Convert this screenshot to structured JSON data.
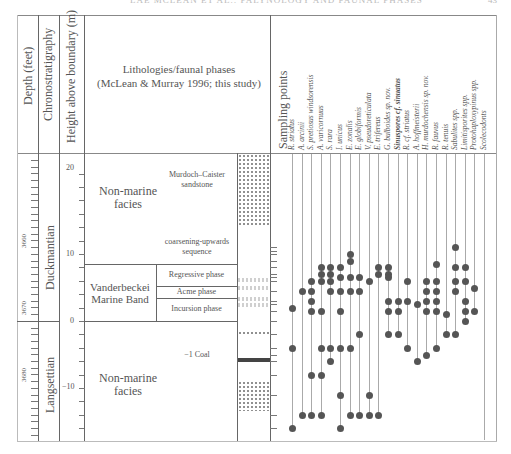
{
  "page": {
    "running_header": "LAE MCLEAN ET AL.: PALYNOLOGY AND FAUNAL PHASES",
    "page_number": "43"
  },
  "headers": {
    "depth": "Depth (feet)",
    "chrono": "Chronostratigraphy",
    "height": "Height above boundary (m)",
    "lithology_line1": "Lithologies/faunal phases",
    "lithology_line2": "(McLean & Murray 1996; this study)",
    "sampling": "Sampling points"
  },
  "depth_ticks": [
    "3660",
    "3670",
    "3680"
  ],
  "height_ticks": [
    "20",
    "10",
    "0",
    "−10"
  ],
  "stages": {
    "upper": "Duckmantian",
    "lower": "Langsettian"
  },
  "lithology": {
    "upper_facies_line1": "Non-marine",
    "upper_facies_line2": "facies",
    "sandstone_line1": "Murdoch–Caister",
    "sandstone_line2": "sandstone",
    "coarsening_line1": "coarsening-upwards",
    "coarsening_line2": "sequence",
    "marine_band_line1": "Vanderbeckei",
    "marine_band_line2": "Marine Band",
    "phases": [
      "Regressive phase",
      "Acme phase",
      "Incursion phase"
    ],
    "coal": "−1 Coal",
    "lower_facies_line1": "Non-marine",
    "lower_facies_line2": "facies"
  },
  "species": [
    "R. striatus",
    "A. arcinii",
    "S. pretiosus windsorensis",
    "A. varicornuus",
    "S. rara",
    "I. unicus",
    "E. zonalis",
    "E. globiformis",
    "V. pseudoreticulata",
    "E. trifereus",
    "G. bulboides sp. nov.",
    "Sinuspores cf. sinuatus",
    "R. cf. striatus",
    "A. hoffmeisterii",
    "H. murdochensis sp. nov.",
    "R. fauvus",
    "R. tenuis",
    "Sabulites spp.",
    "Limitisporites spp.",
    "Protohaploxypinus spp.",
    "Scolecodonts"
  ],
  "chart_data": {
    "type": "range_chart",
    "title": "",
    "ylabel": "Height above boundary (m)",
    "ylim": [
      -18,
      22
    ],
    "secondary_ylabel": "Depth (feet)",
    "secondary_ticks": [
      3660,
      3670,
      3680
    ],
    "height_ticks": [
      20,
      10,
      0,
      -10
    ],
    "units": [
      {
        "name": "Murdoch–Caister sandstone",
        "from_m": 14,
        "to_m": 22,
        "facies": "Non-marine facies"
      },
      {
        "name": "coarsening-upwards sequence",
        "from_m": 8,
        "to_m": 14,
        "facies": "Non-marine facies"
      },
      {
        "name": "Regressive phase",
        "from_m": 4.5,
        "to_m": 8,
        "facies": "Vanderbeckei Marine Band"
      },
      {
        "name": "Acme phase",
        "from_m": 3.5,
        "to_m": 4.5,
        "facies": "Vanderbeckei Marine Band"
      },
      {
        "name": "Incursion phase",
        "from_m": 0,
        "to_m": 3.5,
        "facies": "Vanderbeckei Marine Band"
      },
      {
        "name": "−1 Coal",
        "from_m": -6,
        "to_m": -5.6,
        "facies": "Non-marine facies"
      }
    ],
    "stages": [
      {
        "name": "Duckmantian",
        "from_m": 0,
        "to_m": 22
      },
      {
        "name": "Langsettian",
        "from_m": -18,
        "to_m": 0
      }
    ],
    "series": [
      {
        "name": "R. striatus",
        "occurrences_m": [
          2,
          -4,
          -16
        ]
      },
      {
        "name": "A. arcinii",
        "occurrences_m": [
          4.5,
          -14
        ]
      },
      {
        "name": "S. pretiosus windsorensis",
        "occurrences_m": [
          6,
          4.5,
          3,
          1.5,
          -8,
          -14
        ]
      },
      {
        "name": "A. varicornuus",
        "occurrences_m": [
          8,
          7,
          6,
          1.5,
          -4,
          -8,
          -14
        ]
      },
      {
        "name": "S. rara",
        "occurrences_m": [
          8,
          7,
          6,
          4.5,
          -4,
          -6
        ]
      },
      {
        "name": "I. unicus",
        "occurrences_m": [
          8,
          6.5,
          4.5,
          1.5,
          -4,
          -11,
          -16
        ]
      },
      {
        "name": "E. zonalis",
        "occurrences_m": [
          10,
          9,
          6.5,
          4.5,
          -4,
          -14
        ]
      },
      {
        "name": "E. globiformis",
        "occurrences_m": [
          6.5,
          4.5,
          -2,
          -14
        ]
      },
      {
        "name": "V. pseudoreticulata",
        "occurrences_m": [
          6,
          -11,
          -14
        ]
      },
      {
        "name": "E. trifereus",
        "occurrences_m": [
          8,
          7,
          -14
        ]
      },
      {
        "name": "G. bulboides sp. nov.",
        "occurrences_m": [
          8,
          7,
          6.5,
          3,
          1.5,
          -2
        ]
      },
      {
        "name": "Sinuspores cf. sinuatus",
        "occurrences_m": [
          3,
          1.5,
          -2
        ]
      },
      {
        "name": "R. cf. striatus",
        "occurrences_m": [
          6,
          3,
          -4
        ]
      },
      {
        "name": "A. hoffmeisterii",
        "occurrences_m": [
          2.5,
          -6
        ]
      },
      {
        "name": "H. murdochensis sp. nov.",
        "occurrences_m": [
          6,
          4.5,
          3,
          1.5,
          -5
        ]
      },
      {
        "name": "R. fauvus",
        "occurrences_m": [
          8.5,
          6,
          4.5,
          3,
          1.5,
          -4
        ]
      },
      {
        "name": "R. tenuis",
        "occurrences_m": [
          1,
          -2
        ]
      },
      {
        "name": "Sabulites spp.",
        "occurrences_m": [
          11,
          8,
          6,
          4.5,
          -2
        ]
      },
      {
        "name": "Limitisporites spp.",
        "occurrences_m": [
          8,
          6,
          3,
          1.5,
          0
        ]
      },
      {
        "name": "Protohaploxypinus spp.",
        "occurrences_m": [
          5,
          1.5
        ]
      },
      {
        "name": "Scolecodonts",
        "occurrences_m": []
      }
    ]
  }
}
